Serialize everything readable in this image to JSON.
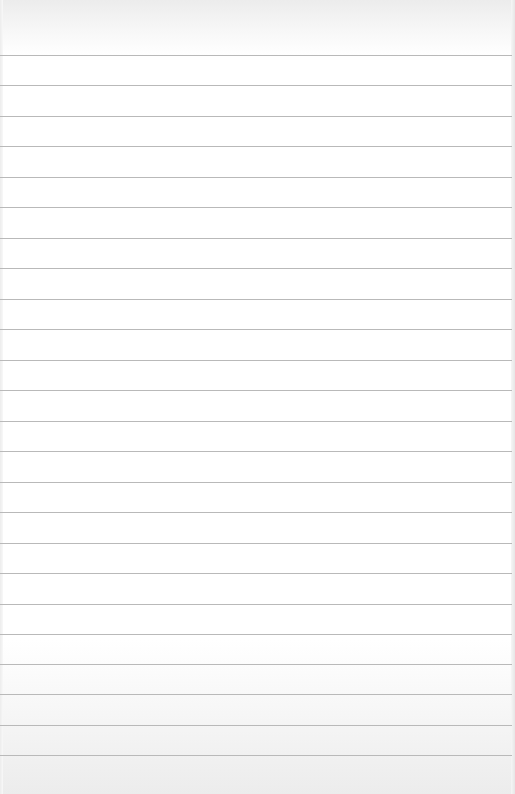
{
  "page": {
    "type": "lined-paper",
    "text": "",
    "rule_color": "#b9b9b9",
    "background_color": "#ffffff",
    "rule_count": 24,
    "rules_y": [
      55,
      85,
      116,
      146,
      177,
      207,
      238,
      268,
      299,
      329,
      360,
      390,
      421,
      451,
      482,
      512,
      543,
      573,
      604,
      634,
      664,
      694,
      725,
      755
    ]
  }
}
